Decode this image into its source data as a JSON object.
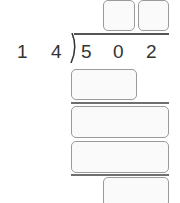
{
  "problem": {
    "divisor": [
      "1",
      "4"
    ],
    "dividend": [
      "5",
      "0",
      "2"
    ]
  },
  "answer_boxes": {
    "quotient": [
      "",
      ""
    ],
    "step1_product": "",
    "step2_remainder": "",
    "step2_product": "",
    "final_remainder": ""
  },
  "colors": {
    "box_border": "#9a9a9a",
    "box_fill": "#fafafa",
    "line": "#6f6f6f",
    "text": "#333333"
  }
}
